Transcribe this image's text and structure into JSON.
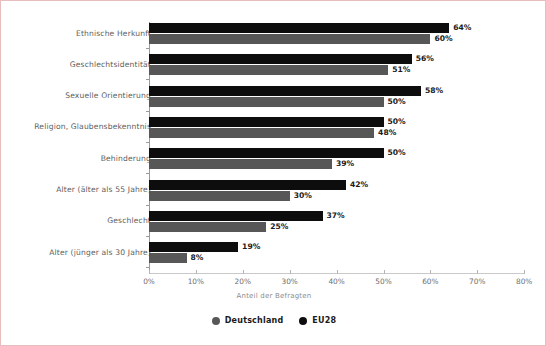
{
  "chart_data": {
    "type": "bar",
    "orientation": "horizontal",
    "title": "",
    "xlabel": "Anteil der Befragten",
    "ylabel": "",
    "xlim": [
      0,
      80
    ],
    "xticks": [
      "0%",
      "10%",
      "20%",
      "30%",
      "40%",
      "50%",
      "60%",
      "70%",
      "80%"
    ],
    "xtick_values": [
      0,
      10,
      20,
      30,
      40,
      50,
      60,
      70,
      80
    ],
    "grid": false,
    "legend_position": "bottom",
    "categories": [
      "Ethnische Herkunft",
      "Geschlechtsidentität",
      "Sexuelle Orientierung",
      "Religion, Glaubensbekenntnis",
      "Behinderung",
      "Alter (älter als 55 Jahre)",
      "Geschlecht",
      "Alter (jünger als 30 Jahre)"
    ],
    "series": [
      {
        "name": "EU28",
        "color": "#0d0d0d",
        "values": [
          64,
          56,
          58,
          50,
          50,
          42,
          37,
          19
        ],
        "labels": [
          "64%",
          "56%",
          "58%",
          "50%",
          "50%",
          "42%",
          "37%",
          "19%"
        ]
      },
      {
        "name": "Deutschland",
        "color": "#575757",
        "values": [
          60,
          51,
          50,
          48,
          39,
          30,
          25,
          8
        ],
        "labels": [
          "60%",
          "51%",
          "50%",
          "48%",
          "39%",
          "30%",
          "25%",
          "8%"
        ]
      }
    ],
    "legend": [
      {
        "label": "Deutschland",
        "color": "#575757",
        "marker": "circle"
      },
      {
        "label": "EU28",
        "color": "#0d0d0d",
        "marker": "circle"
      }
    ]
  },
  "frame": {
    "border_color": "#e8bdbd",
    "background": "#ffffff"
  }
}
